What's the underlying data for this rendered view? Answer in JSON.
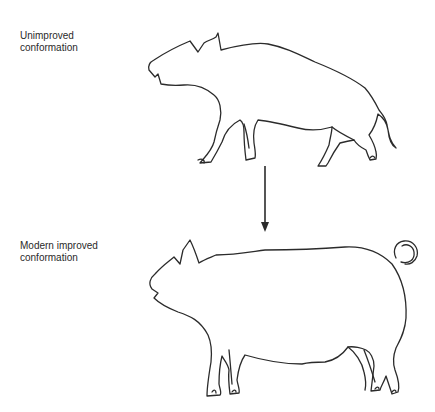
{
  "figure": {
    "top_label": "Unimproved\nconformation",
    "bottom_label": "Modern improved\nconformation",
    "colors": {
      "line": "#2b2b2b",
      "text": "#2a2a2a",
      "background": "#ffffff"
    },
    "elements": [
      {
        "name": "unimproved-pig-outline",
        "description": "wild-type pig with long snout, high shoulders, sloping back, thin legs"
      },
      {
        "name": "transition-arrow",
        "direction": "down"
      },
      {
        "name": "improved-pig-outline",
        "description": "modern pig with long level back, deep body, curly tail"
      }
    ]
  }
}
